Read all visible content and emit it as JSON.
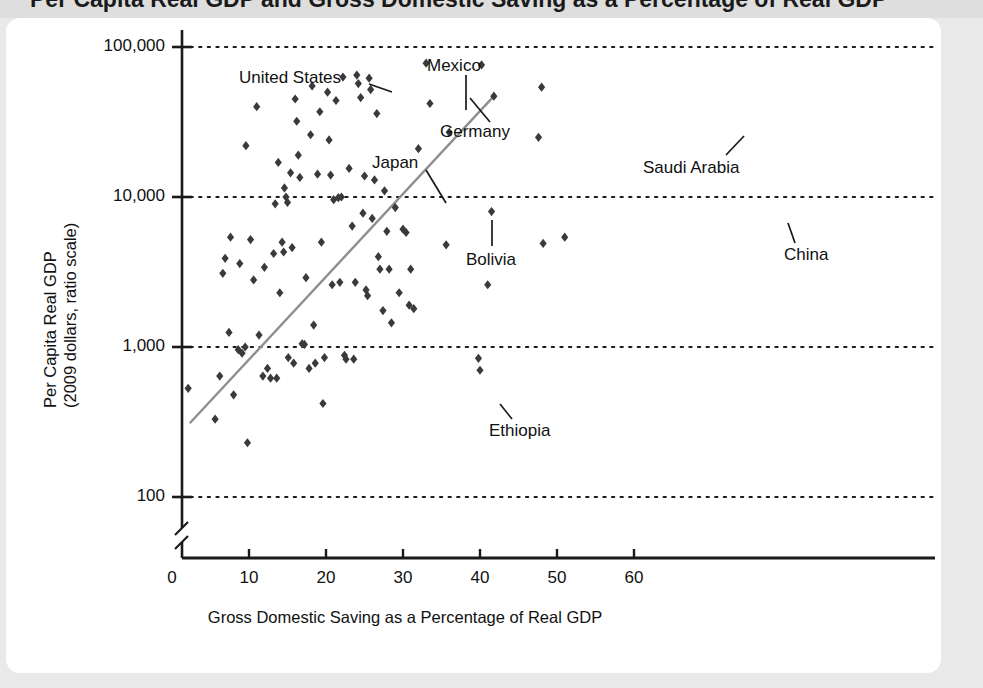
{
  "title": "Per Capita Real GDP and Gross Domestic Saving as a Percentage of Real GDP",
  "axes": {
    "y_label_line1": "Per Capita Real GDP",
    "y_label_line2": "(2009 dollars, ratio scale)",
    "x_label": "Gross Domestic Saving as a Percentage of Real GDP"
  },
  "chart_data": {
    "type": "scatter",
    "title": "",
    "xlabel": "Gross Domestic Saving as a Percentage of Real GDP",
    "ylabel": "Per Capita Real GDP (2009 dollars, ratio scale)",
    "yscale": "log",
    "ylim": [
      100,
      100000
    ],
    "xlim": [
      0,
      63
    ],
    "grid": true,
    "legend": "none",
    "y_ticks": [
      "100",
      "1,000",
      "10,000",
      "100,000"
    ],
    "y_tick_values": [
      100,
      1000,
      10000,
      100000
    ],
    "x_ticks": [
      "0",
      "10",
      "20",
      "30",
      "40",
      "50",
      "60"
    ],
    "x_tick_values": [
      0,
      10,
      20,
      30,
      40,
      50,
      60
    ],
    "axis_break": true,
    "marker": "diamond",
    "marker_color": "#3a3a3a",
    "trendline": {
      "color": "#8f8f8f",
      "x_start": 2.3,
      "y_start": 310,
      "x_end": 41.8,
      "y_end": 47000
    },
    "points": [
      {
        "x": 2.1,
        "y": 530
      },
      {
        "x": 5.6,
        "y": 330
      },
      {
        "x": 6.2,
        "y": 640
      },
      {
        "x": 6.6,
        "y": 3100
      },
      {
        "x": 6.9,
        "y": 3900
      },
      {
        "x": 7.4,
        "y": 1250
      },
      {
        "x": 7.6,
        "y": 5400
      },
      {
        "x": 8.0,
        "y": 480
      },
      {
        "x": 8.6,
        "y": 960
      },
      {
        "x": 8.8,
        "y": 3600
      },
      {
        "x": 9.1,
        "y": 910
      },
      {
        "x": 9.5,
        "y": 1000
      },
      {
        "x": 9.6,
        "y": 22000
      },
      {
        "x": 9.8,
        "y": 230
      },
      {
        "x": 10.2,
        "y": 5200
      },
      {
        "x": 10.6,
        "y": 2800
      },
      {
        "x": 11.0,
        "y": 40000
      },
      {
        "x": 11.3,
        "y": 1200
      },
      {
        "x": 11.8,
        "y": 640
      },
      {
        "x": 12.0,
        "y": 3400
      },
      {
        "x": 12.4,
        "y": 720
      },
      {
        "x": 12.8,
        "y": 620
      },
      {
        "x": 13.2,
        "y": 4200
      },
      {
        "x": 13.4,
        "y": 9000
      },
      {
        "x": 13.6,
        "y": 620
      },
      {
        "x": 13.8,
        "y": 17000
      },
      {
        "x": 14.0,
        "y": 2300
      },
      {
        "x": 14.3,
        "y": 5000
      },
      {
        "x": 14.5,
        "y": 4300
      },
      {
        "x": 14.6,
        "y": 11500
      },
      {
        "x": 14.8,
        "y": 10000
      },
      {
        "x": 15.0,
        "y": 9200
      },
      {
        "x": 15.1,
        "y": 850
      },
      {
        "x": 15.4,
        "y": 14500
      },
      {
        "x": 15.6,
        "y": 4600
      },
      {
        "x": 15.8,
        "y": 780
      },
      {
        "x": 16.0,
        "y": 45000
      },
      {
        "x": 16.2,
        "y": 32000
      },
      {
        "x": 16.4,
        "y": 19000
      },
      {
        "x": 16.6,
        "y": 13500
      },
      {
        "x": 16.9,
        "y": 1050
      },
      {
        "x": 17.2,
        "y": 1040
      },
      {
        "x": 17.4,
        "y": 2900
      },
      {
        "x": 17.8,
        "y": 720
      },
      {
        "x": 18.0,
        "y": 26000
      },
      {
        "x": 18.2,
        "y": 55000
      },
      {
        "x": 18.4,
        "y": 1400
      },
      {
        "x": 18.6,
        "y": 780
      },
      {
        "x": 18.9,
        "y": 14200
      },
      {
        "x": 19.2,
        "y": 37000
      },
      {
        "x": 19.4,
        "y": 5000
      },
      {
        "x": 19.6,
        "y": 420
      },
      {
        "x": 19.8,
        "y": 850
      },
      {
        "x": 20.2,
        "y": 50000
      },
      {
        "x": 20.4,
        "y": 24000
      },
      {
        "x": 20.6,
        "y": 14000
      },
      {
        "x": 20.8,
        "y": 2600
      },
      {
        "x": 21.0,
        "y": 9600
      },
      {
        "x": 21.3,
        "y": 44000
      },
      {
        "x": 21.6,
        "y": 9900
      },
      {
        "x": 21.8,
        "y": 2700
      },
      {
        "x": 22.0,
        "y": 10000
      },
      {
        "x": 22.2,
        "y": 63000
      },
      {
        "x": 22.4,
        "y": 880
      },
      {
        "x": 22.6,
        "y": 830
      },
      {
        "x": 23.0,
        "y": 15500
      },
      {
        "x": 23.4,
        "y": 6400
      },
      {
        "x": 23.6,
        "y": 830
      },
      {
        "x": 23.8,
        "y": 2700
      },
      {
        "x": 24.0,
        "y": 65000
      },
      {
        "x": 24.2,
        "y": 57000
      },
      {
        "x": 24.5,
        "y": 46000
      },
      {
        "x": 24.8,
        "y": 7800
      },
      {
        "x": 25.0,
        "y": 13800
      },
      {
        "x": 25.2,
        "y": 2400
      },
      {
        "x": 25.4,
        "y": 2200
      },
      {
        "x": 25.6,
        "y": 62000
      },
      {
        "x": 25.8,
        "y": 52000
      },
      {
        "x": 26.0,
        "y": 7200
      },
      {
        "x": 26.3,
        "y": 13000
      },
      {
        "x": 26.6,
        "y": 36000
      },
      {
        "x": 26.8,
        "y": 4000
      },
      {
        "x": 27.0,
        "y": 3300
      },
      {
        "x": 27.4,
        "y": 1750
      },
      {
        "x": 27.6,
        "y": 11000
      },
      {
        "x": 27.9,
        "y": 5900
      },
      {
        "x": 28.2,
        "y": 3300
      },
      {
        "x": 28.5,
        "y": 1450
      },
      {
        "x": 29.0,
        "y": 8500
      },
      {
        "x": 29.5,
        "y": 2300
      },
      {
        "x": 30.0,
        "y": 6100
      },
      {
        "x": 30.4,
        "y": 5800
      },
      {
        "x": 30.8,
        "y": 1900
      },
      {
        "x": 31.0,
        "y": 3300
      },
      {
        "x": 31.4,
        "y": 1800
      },
      {
        "x": 32.0,
        "y": 21000
      },
      {
        "x": 33.0,
        "y": 78000
      },
      {
        "x": 33.5,
        "y": 42000
      },
      {
        "x": 35.6,
        "y": 4800
      },
      {
        "x": 36.0,
        "y": 27000
      },
      {
        "x": 39.8,
        "y": 840
      },
      {
        "x": 40.0,
        "y": 700
      },
      {
        "x": 40.2,
        "y": 76000
      },
      {
        "x": 41.0,
        "y": 2600
      },
      {
        "x": 41.5,
        "y": 8000
      },
      {
        "x": 41.8,
        "y": 47000
      },
      {
        "x": 47.6,
        "y": 25000
      },
      {
        "x": 48.0,
        "y": 54000
      },
      {
        "x": 48.2,
        "y": 4900
      },
      {
        "x": 51.0,
        "y": 5400
      }
    ],
    "annotations": [
      {
        "label": "United States",
        "point_x": 19.2,
        "point_y": 37000
      },
      {
        "label": "Mexico",
        "point_x": 19.2,
        "point_y": 37000
      },
      {
        "label": "Germany",
        "point_x": 21.3,
        "point_y": 44000
      },
      {
        "label": "Japan",
        "point_x": 22.0,
        "point_y": 10000
      },
      {
        "label": "Saudi Arabia",
        "point_x": 47.6,
        "point_y": 25000
      },
      {
        "label": "China",
        "point_x": 51.0,
        "point_y": 5400
      },
      {
        "label": "Bolivia",
        "point_x": 26.0,
        "point_y": 7200
      },
      {
        "label": "Ethiopia",
        "point_x": 28.5,
        "point_y": 430
      }
    ]
  }
}
